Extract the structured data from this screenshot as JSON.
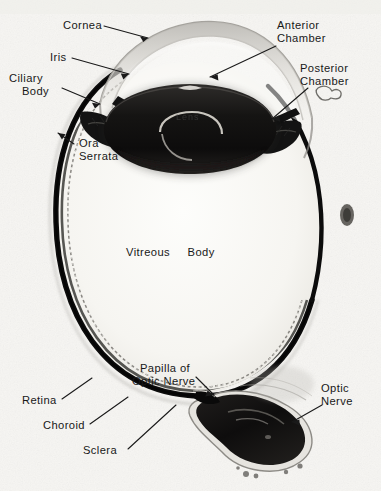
{
  "figure": {
    "background_color": "#f7f6f3",
    "ink_color": "#181818"
  },
  "labels": {
    "cornea": "Cornea",
    "iris": "Iris",
    "ciliary_body_l1": "Ciliary",
    "ciliary_body_l2": "Body",
    "ora_serrata_l1": "Ora",
    "ora_serrata_l2": "Serrata",
    "anterior_chamber_l1": "Anterior",
    "anterior_chamber_l2": "Chamber",
    "posterior_chamber_l1": "Posterior",
    "posterior_chamber_l2": "Chamber",
    "vitreous_body": "Vitreous     Body",
    "papilla_l1": "Papilla of",
    "papilla_l2": "Optic Nerve",
    "optic_nerve_l1": "Optic",
    "optic_nerve_l2": "Nerve",
    "retina": "Retina",
    "choroid": "Choroid",
    "sclera": "Sclera",
    "lens": "Lens"
  },
  "structures": [
    {
      "name": "sclera-wall",
      "label": "Sclera",
      "tone": "#101010"
    },
    {
      "name": "choroid-layer",
      "label": "Choroid",
      "tone": "#1c1c1c"
    },
    {
      "name": "retina-layer",
      "label": "Retina",
      "tone": "#2a2a2a"
    },
    {
      "name": "cornea-dome",
      "label": "Cornea",
      "tone": "#cfcdc8"
    },
    {
      "name": "lens-body",
      "label": "Lens",
      "tone": "#151515"
    },
    {
      "name": "iris-leaflet",
      "label": "Iris",
      "tone": "#141414"
    },
    {
      "name": "ciliary-body",
      "label": "Ciliary Body",
      "tone": "#121212"
    },
    {
      "name": "vitreous-cavity",
      "label": "Vitreous Body",
      "tone": "#fafaf8"
    },
    {
      "name": "optic-nerve-head",
      "label": "Optic Nerve",
      "tone": "#141414"
    },
    {
      "name": "optic-disc",
      "label": "Papilla of Optic Nerve",
      "tone": "#101010"
    }
  ]
}
